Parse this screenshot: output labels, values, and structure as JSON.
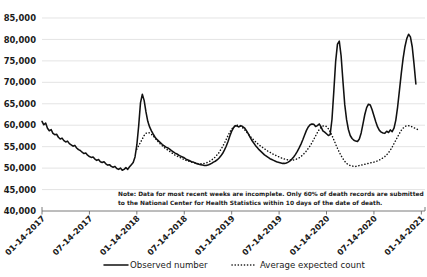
{
  "chart_data": {
    "type": "line",
    "title": "",
    "subtitle": "",
    "xlabel": "",
    "ylabel": "",
    "ylim": [
      40000,
      85000
    ],
    "ytick_values": [
      40000,
      45000,
      50000,
      55000,
      60000,
      65000,
      70000,
      75000,
      80000,
      85000
    ],
    "ytick_labels": [
      "40,000",
      "45,000",
      "50,000",
      "55,000",
      "60,000",
      "65,000",
      "70,000",
      "75,000",
      "80,000",
      "85,000"
    ],
    "xtick_labels": [
      "01-14-2017",
      "07-14-2017",
      "01-14-2018",
      "07-14-2018",
      "01-14-2019",
      "07-14-2019",
      "01-14-2020",
      "07-14-2020",
      "01-14-2021"
    ],
    "xlim_weeks": [
      0,
      210
    ],
    "xtick_weeks": [
      0,
      26,
      52,
      78,
      104,
      130,
      156,
      182,
      208
    ],
    "grid": true,
    "legend_position": "bottom",
    "series": [
      {
        "name": "Observed number",
        "style": "solid",
        "color": "#111111",
        "x_weeks": [
          0,
          1,
          2,
          3,
          4,
          5,
          6,
          7,
          8,
          9,
          10,
          11,
          12,
          13,
          14,
          15,
          16,
          17,
          18,
          19,
          20,
          21,
          22,
          23,
          24,
          25,
          26,
          27,
          28,
          29,
          30,
          31,
          32,
          33,
          34,
          35,
          36,
          37,
          38,
          39,
          40,
          41,
          42,
          43,
          44,
          45,
          46,
          47,
          48,
          49,
          50,
          51,
          52,
          53,
          54,
          55,
          56,
          57,
          58,
          59,
          60,
          61,
          62,
          63,
          64,
          65,
          66,
          67,
          68,
          69,
          70,
          71,
          72,
          73,
          74,
          75,
          76,
          77,
          78,
          79,
          80,
          81,
          82,
          83,
          84,
          85,
          86,
          87,
          88,
          89,
          90,
          91,
          92,
          93,
          94,
          95,
          96,
          97,
          98,
          99,
          100,
          101,
          102,
          103,
          104,
          105,
          106,
          107,
          108,
          109,
          110,
          111,
          112,
          113,
          114,
          115,
          116,
          117,
          118,
          119,
          120,
          121,
          122,
          123,
          124,
          125,
          126,
          127,
          128,
          129,
          130,
          131,
          132,
          133,
          134,
          135,
          136,
          137,
          138,
          139,
          140,
          141,
          142,
          143,
          144,
          145,
          146,
          147,
          148,
          149,
          150,
          151,
          152,
          153,
          154,
          155,
          156,
          157,
          158,
          159,
          160,
          161,
          162,
          163,
          164,
          165,
          166,
          167,
          168,
          169,
          170,
          171,
          172,
          173,
          174,
          175,
          176,
          177,
          178,
          179,
          180,
          181,
          182,
          183,
          184,
          185,
          186,
          187,
          188,
          189,
          190,
          191,
          192,
          193,
          194,
          195,
          196,
          197,
          198,
          199,
          200,
          201,
          202,
          203,
          204,
          205,
          206,
          207,
          208,
          209
        ],
        "values": [
          60900,
          60100,
          60500,
          59300,
          58700,
          59000,
          58100,
          57800,
          57900,
          57200,
          56800,
          57000,
          56400,
          56100,
          56300,
          55700,
          55400,
          55100,
          55300,
          54700,
          54300,
          54100,
          53700,
          53400,
          53500,
          53000,
          52700,
          52500,
          52600,
          52100,
          51800,
          52000,
          51500,
          51300,
          51500,
          51000,
          50700,
          50800,
          50400,
          50200,
          50400,
          49900,
          49700,
          50000,
          49500,
          49700,
          50100,
          49700,
          50300,
          50800,
          51300,
          52600,
          55400,
          59800,
          65200,
          67200,
          65800,
          63100,
          60900,
          59600,
          58700,
          57900,
          57200,
          56700,
          56300,
          55900,
          55500,
          55200,
          54900,
          54700,
          54400,
          54100,
          53800,
          53500,
          53300,
          53000,
          52800,
          52600,
          52400,
          52100,
          51900,
          51700,
          51500,
          51400,
          51200,
          51000,
          50900,
          50800,
          50700,
          50600,
          50600,
          50700,
          50900,
          51100,
          51400,
          51600,
          51900,
          52300,
          52800,
          53400,
          54200,
          55100,
          56200,
          57500,
          58600,
          59400,
          59900,
          59800,
          59600,
          59900,
          59700,
          59400,
          58800,
          58100,
          57300,
          56500,
          55900,
          55300,
          54800,
          54300,
          53900,
          53500,
          53100,
          52800,
          52500,
          52200,
          52000,
          51800,
          51600,
          51400,
          51300,
          51200,
          51100,
          51100,
          51200,
          51400,
          51700,
          52100,
          52600,
          53200,
          53900,
          54700,
          55600,
          56600,
          57700,
          58800,
          59600,
          60100,
          60300,
          60200,
          59700,
          59900,
          60300,
          59600,
          58700,
          58400,
          58000,
          57600,
          57800,
          61400,
          67900,
          74800,
          78900,
          79600,
          76200,
          70300,
          64800,
          61300,
          59000,
          57600,
          56900,
          56500,
          56300,
          56200,
          56800,
          58200,
          60300,
          62500,
          64100,
          64900,
          64700,
          63600,
          62200,
          60800,
          59600,
          58800,
          58400,
          58200,
          58100,
          58600,
          58300,
          58900,
          58500,
          59300,
          61200,
          64300,
          68200,
          72100,
          75600,
          78300,
          80200,
          81200,
          80600,
          78300,
          74200,
          69600
        ]
      },
      {
        "name": "Average expected count",
        "style": "dotted",
        "color": "#111111",
        "x_weeks": [
          52,
          53,
          54,
          55,
          56,
          57,
          58,
          59,
          60,
          61,
          62,
          63,
          64,
          65,
          66,
          67,
          68,
          69,
          70,
          71,
          72,
          73,
          74,
          75,
          76,
          77,
          78,
          79,
          80,
          81,
          82,
          83,
          84,
          85,
          86,
          87,
          88,
          89,
          90,
          91,
          92,
          93,
          94,
          95,
          96,
          97,
          98,
          99,
          100,
          101,
          102,
          103,
          104,
          105,
          106,
          107,
          108,
          109,
          110,
          111,
          112,
          113,
          114,
          115,
          116,
          117,
          118,
          119,
          120,
          121,
          122,
          123,
          124,
          125,
          126,
          127,
          128,
          129,
          130,
          131,
          132,
          133,
          134,
          135,
          136,
          137,
          138,
          139,
          140,
          141,
          142,
          143,
          144,
          145,
          146,
          147,
          148,
          149,
          150,
          151,
          152,
          153,
          154,
          155,
          156,
          157,
          158,
          159,
          160,
          161,
          162,
          163,
          164,
          165,
          166,
          167,
          168,
          169,
          170,
          171,
          172,
          173,
          174,
          175,
          176,
          177,
          178,
          179,
          180,
          181,
          182,
          183,
          184,
          185,
          186,
          187,
          188,
          189,
          190,
          191,
          192,
          193,
          194,
          195,
          196,
          197,
          198,
          199,
          200,
          201,
          202,
          203,
          204,
          205,
          206,
          207,
          208,
          209
        ],
        "values": [
          54400,
          55200,
          56000,
          56800,
          57600,
          58100,
          58300,
          58200,
          57900,
          57500,
          57000,
          56500,
          56000,
          55600,
          55200,
          54800,
          54500,
          54200,
          53900,
          53600,
          53300,
          53000,
          52800,
          52600,
          52400,
          52200,
          52000,
          51800,
          51700,
          51500,
          51400,
          51300,
          51200,
          51100,
          51000,
          51000,
          51000,
          51100,
          51200,
          51400,
          51600,
          51900,
          52200,
          52600,
          53100,
          53600,
          54300,
          55000,
          55800,
          56700,
          57600,
          58400,
          59100,
          59600,
          59900,
          60000,
          59900,
          59700,
          59400,
          59000,
          58500,
          58000,
          57500,
          57000,
          56600,
          56200,
          55800,
          55400,
          55100,
          54800,
          54500,
          54200,
          53900,
          53700,
          53400,
          53200,
          53000,
          52800,
          52600,
          52400,
          52300,
          52100,
          52000,
          51900,
          51900,
          51900,
          51900,
          52000,
          52200,
          52400,
          52700,
          53100,
          53500,
          54000,
          54600,
          55200,
          55900,
          56700,
          57500,
          58300,
          59000,
          59500,
          59800,
          59900,
          59700,
          59200,
          58500,
          57600,
          56600,
          55600,
          54600,
          53700,
          52900,
          52200,
          51600,
          51100,
          50800,
          50600,
          50500,
          50400,
          50400,
          50500,
          50600,
          50700,
          50800,
          50900,
          51000,
          51100,
          51200,
          51300,
          51400,
          51500,
          51700,
          51900,
          52100,
          52400,
          52700,
          53100,
          53600,
          54200,
          54900,
          55700,
          56500,
          57300,
          58100,
          58800,
          59300,
          59700,
          59900,
          59900,
          59800,
          59600,
          59400,
          59200,
          59000,
          58800
        ]
      }
    ],
    "annotation": {
      "line1": "Note: Data for most recent weeks are incomplete. Only 60% of death records are submitted",
      "line2": "to the National Center for Health Statistics within 10 days of the date of death."
    },
    "legend": [
      {
        "label": "Observed number",
        "style": "solid"
      },
      {
        "label": "Average expected count",
        "style": "dotted"
      }
    ]
  }
}
